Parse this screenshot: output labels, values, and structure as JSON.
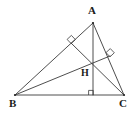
{
  "figure": {
    "background_color": "#ffffff",
    "stroke_color": "#3a3a3a",
    "label_color": "#1b1b1b",
    "labels": {
      "A": "A",
      "B": "B",
      "C": "C",
      "H": "H"
    },
    "points": {
      "A": {
        "x": 93,
        "y": 23
      },
      "B": {
        "x": 15,
        "y": 95
      },
      "C": {
        "x": 124,
        "y": 95
      },
      "H": {
        "x": 93,
        "y": 61
      },
      "foot_from_A_on_BC": {
        "x": 93,
        "y": 95
      },
      "foot_from_C_on_AB": {
        "x": 71,
        "y": 43
      },
      "foot_from_B_on_AC": {
        "x": 110,
        "y": 56
      }
    },
    "segments": [
      {
        "name": "side-AB",
        "from": "A",
        "to": "B"
      },
      {
        "name": "side-BC",
        "from": "B",
        "to": "C"
      },
      {
        "name": "side-CA",
        "from": "C",
        "to": "A"
      },
      {
        "name": "altitude-from-A",
        "from": "A",
        "to": "foot_from_A_on_BC"
      },
      {
        "name": "altitude-from-C",
        "from": "C",
        "to": "foot_from_C_on_AB"
      },
      {
        "name": "altitude-from-B",
        "from": "B",
        "to": "foot_from_B_on_AC"
      }
    ],
    "right_angle_marks": [
      {
        "name": "right-angle-on-AB",
        "x": 71,
        "y": 43
      },
      {
        "name": "right-angle-on-AC",
        "x": 110,
        "y": 56
      },
      {
        "name": "right-angle-on-BC",
        "x": 93,
        "y": 95
      }
    ]
  }
}
